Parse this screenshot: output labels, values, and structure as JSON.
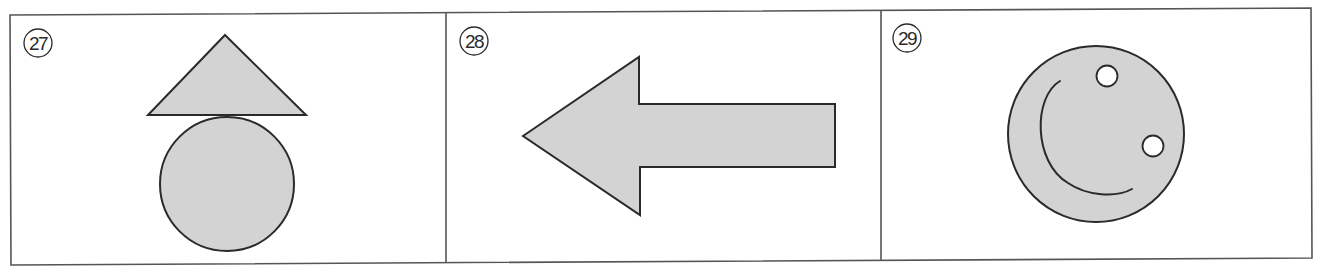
{
  "colors": {
    "stroke": "#2a2a2a",
    "frame": "#555555",
    "fill": "#d3d3d3",
    "background": "#ffffff",
    "eye": "#ffffff"
  },
  "panels": [
    {
      "number": "27",
      "label": "㉗",
      "description": "Triangle above a circle (upward arrow-like figure)",
      "shapes": [
        "triangle",
        "circle"
      ]
    },
    {
      "number": "28",
      "label": "㉘",
      "description": "Arrow pointing left",
      "shapes": [
        "left-arrow"
      ]
    },
    {
      "number": "29",
      "label": "㉙",
      "description": "Circle with two small white dots and a curved line (face-like figure)",
      "shapes": [
        "circle",
        "dot",
        "dot",
        "arc"
      ]
    }
  ]
}
